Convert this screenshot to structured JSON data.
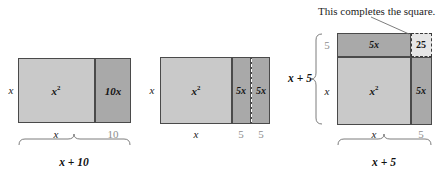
{
  "figure": {
    "annotation": {
      "text": "This completes the square.",
      "target": "25-square"
    },
    "colors": {
      "fill_light": "#c9c9c9",
      "fill_dark": "#a9a9a9",
      "fill_pale": "#e6e6e6",
      "stroke": "#4a4a4a",
      "label_gray": "#8d8d8d",
      "background": "#ffffff"
    },
    "panels": [
      {
        "id": "panel-1",
        "expression": "x^2 + 10x",
        "regions": [
          {
            "name": "x-squared",
            "label": "x",
            "exponent": "2",
            "shade": "light"
          },
          {
            "name": "ten-x",
            "label": "10x",
            "shade": "dark"
          }
        ],
        "left_label": "x",
        "bottom_labels": [
          "x",
          "10"
        ],
        "brace_label": "x + 10"
      },
      {
        "id": "panel-2",
        "expression": "x^2 + 5x + 5x",
        "regions": [
          {
            "name": "x-squared",
            "label": "x",
            "exponent": "2",
            "shade": "light"
          },
          {
            "name": "five-x-left",
            "label": "5x",
            "shade": "dark"
          },
          {
            "name": "five-x-right",
            "label": "5x",
            "shade": "dark"
          }
        ],
        "left_label": "x",
        "bottom_labels": [
          "x",
          "5",
          "5"
        ],
        "split_style": "dashed"
      },
      {
        "id": "panel-3",
        "expression": "(x + 5)^2",
        "regions": [
          {
            "name": "five-x-top",
            "label": "5x",
            "shade": "dark"
          },
          {
            "name": "twenty-five",
            "label": "25",
            "shade": "pale",
            "border": "dashed"
          },
          {
            "name": "x-squared",
            "label": "x",
            "exponent": "2",
            "shade": "light"
          },
          {
            "name": "five-x-right",
            "label": "5x",
            "shade": "dark"
          }
        ],
        "left_labels": [
          "5",
          "x"
        ],
        "left_brace_label": "x + 5",
        "bottom_labels": [
          "x",
          "5"
        ],
        "brace_label": "x + 5"
      }
    ]
  }
}
